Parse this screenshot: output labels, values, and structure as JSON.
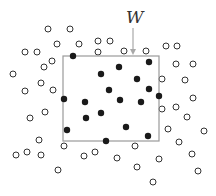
{
  "diagram": {
    "window_label": "W",
    "colors": {
      "window_border": "#9a9a9a",
      "arrow": "#a8a8a8",
      "filled_point": "#1a1a1a",
      "hollow_point_stroke": "#333333",
      "label": "#333333"
    },
    "window": {
      "x": 63,
      "y": 56,
      "width": 96,
      "height": 85
    },
    "arrow": {
      "x": 133,
      "y1": 28,
      "y2": 55
    },
    "label_pos": {
      "x": 126,
      "y": 23
    },
    "filled_points": [
      [
        73,
        56
      ],
      [
        149,
        62
      ],
      [
        119,
        67
      ],
      [
        101,
        74
      ],
      [
        137,
        79
      ],
      [
        109,
        90
      ],
      [
        149,
        89
      ],
      [
        159,
        96
      ],
      [
        64,
        99
      ],
      [
        85,
        102
      ],
      [
        120,
        100
      ],
      [
        141,
        102
      ],
      [
        101,
        113
      ],
      [
        86,
        118
      ],
      [
        67,
        130
      ],
      [
        126,
        127
      ],
      [
        148,
        136
      ],
      [
        106,
        141
      ]
    ],
    "hollow_points": [
      [
        48,
        29
      ],
      [
        70,
        29
      ],
      [
        57,
        44
      ],
      [
        79,
        44
      ],
      [
        98,
        41
      ],
      [
        110,
        41
      ],
      [
        25,
        52
      ],
      [
        37,
        52
      ],
      [
        98,
        52
      ],
      [
        124,
        51
      ],
      [
        146,
        51
      ],
      [
        166,
        46
      ],
      [
        177,
        46
      ],
      [
        52,
        61
      ],
      [
        44,
        67
      ],
      [
        176,
        64
      ],
      [
        193,
        64
      ],
      [
        13,
        74
      ],
      [
        162,
        79
      ],
      [
        185,
        80
      ],
      [
        41,
        83
      ],
      [
        25,
        91
      ],
      [
        53,
        90
      ],
      [
        193,
        98
      ],
      [
        162,
        109
      ],
      [
        176,
        107
      ],
      [
        45,
        112
      ],
      [
        30,
        118
      ],
      [
        187,
        117
      ],
      [
        168,
        129
      ],
      [
        204,
        131
      ],
      [
        39,
        140
      ],
      [
        179,
        142
      ],
      [
        64,
        146
      ],
      [
        135,
        146
      ],
      [
        16,
        155
      ],
      [
        27,
        152
      ],
      [
        41,
        155
      ],
      [
        84,
        156
      ],
      [
        95,
        152
      ],
      [
        117,
        158
      ],
      [
        159,
        159
      ],
      [
        192,
        154
      ],
      [
        58,
        170
      ],
      [
        137,
        167
      ],
      [
        198,
        171
      ],
      [
        153,
        182
      ]
    ]
  }
}
